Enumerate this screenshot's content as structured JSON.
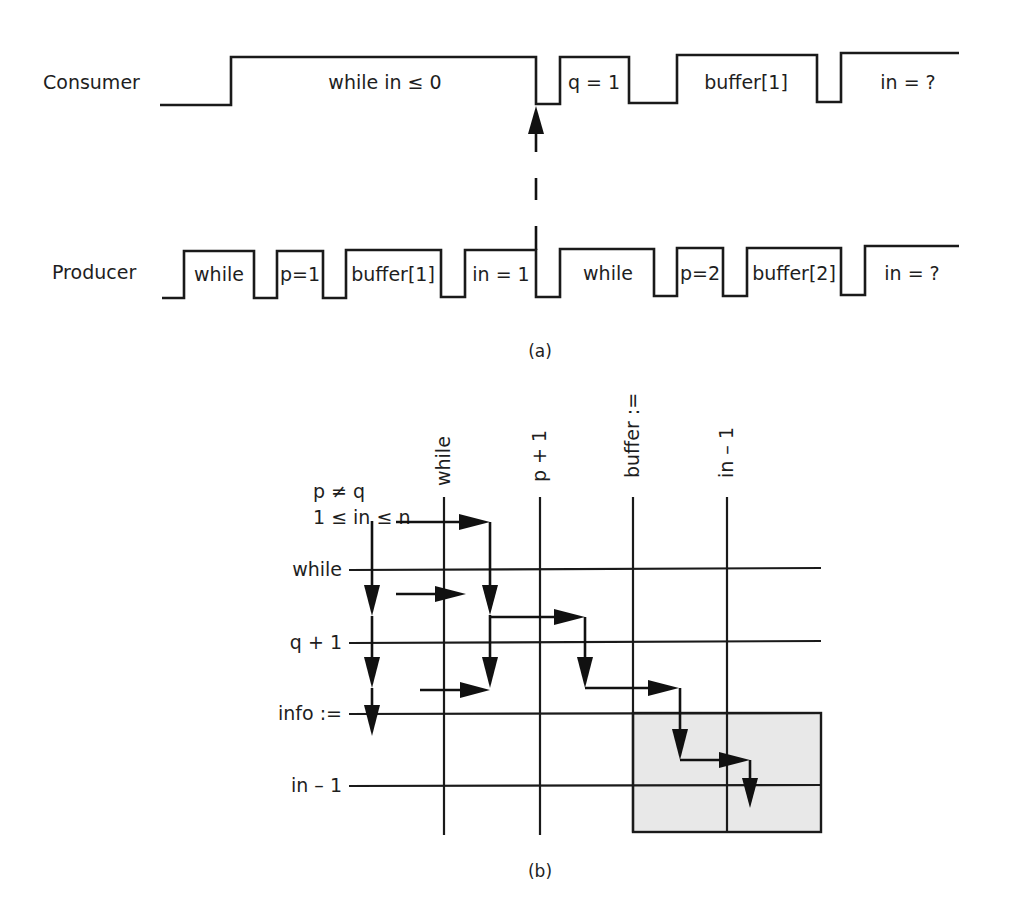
{
  "figure_a": {
    "caption": "(a)",
    "consumer": {
      "label": "Consumer",
      "segments": [
        "while in ≤ 0",
        "q = 1",
        "buffer[1]",
        "in = ?"
      ]
    },
    "producer": {
      "label": "Producer",
      "segments": [
        "while",
        "p=1",
        "buffer[1]",
        "in = 1",
        "while",
        "p=2",
        "buffer[2]",
        "in = ?"
      ]
    },
    "sync_arrow": "dashed arrow from producer 'in = 1' end up to consumer"
  },
  "figure_b": {
    "caption": "(b)",
    "preconditions": [
      "p ≠ q",
      "1 ≤ in ≤ n"
    ],
    "columns": [
      "while",
      "p + 1",
      "buffer :=",
      "in – 1"
    ],
    "rows": [
      "while",
      "q + 1",
      "info :=",
      "in – 1"
    ],
    "shaded_region": "rows info:= to in–1, columns buffer:= to right edge"
  }
}
